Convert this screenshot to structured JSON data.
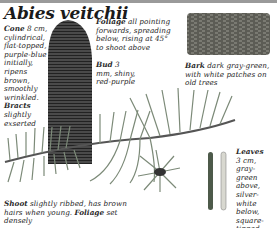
{
  "title": "Abies veitchii",
  "captions": {
    "cone": {
      "term": "Cone",
      "text": "8 cm, cylindrical, flat-topped, purple-blue initially, ripens brown, smoothly wrinkled."
    },
    "bracts": {
      "term": "Bracts",
      "text": "slightly exserted"
    },
    "foliage": {
      "term": "Foliage",
      "text": "all pointing forwards, spreading below, rising at 45° to shoot above"
    },
    "bud": {
      "term": "Bud",
      "text": "3 mm, shiny, red-purple"
    },
    "bark": {
      "term": "Bark",
      "text": "dark gray-green, with white patches on old trees"
    },
    "leaves": {
      "term": "Leaves",
      "text": "3 cm, gray-green above, silver-white below, square-tipped"
    },
    "shoot": {
      "term": "Shoot",
      "text": "slightly ribbed, has brown hairs when young.",
      "term2": "Foliage",
      "text2": "set densely"
    }
  },
  "illustrations": {
    "cone": "cone-illustration",
    "bark": "bark-sample-illustration",
    "branch": "branch-illustration",
    "leaves": "leaf-needles-illustration"
  },
  "colors": {
    "ink": "#2a2a2a",
    "bar": "#9a9a9a",
    "foliage": "#7c8a78",
    "cone": "#3a3a3a",
    "bark": "#6e6e66"
  }
}
